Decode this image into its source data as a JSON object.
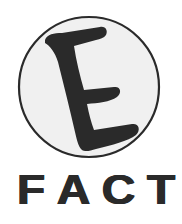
{
  "logo": {
    "emblem_letter": "E",
    "emblem_shape": "circle",
    "wordmark": "FACT",
    "wordmark_letters": [
      "F",
      "A",
      "C",
      "T"
    ]
  },
  "colors": {
    "background": "#ffffff",
    "circle_fill": "#f0f0f0",
    "circle_stroke": "#2a2a2a",
    "ink": "#2a2a2a"
  }
}
